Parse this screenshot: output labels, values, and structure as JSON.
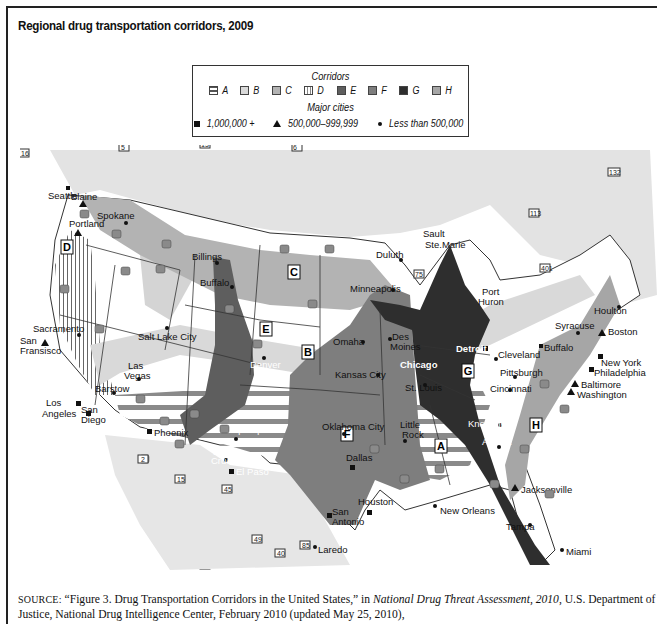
{
  "title": "Regional drug transportation corridors, 2009",
  "legend": {
    "corridors_heading": "Corridors",
    "corridors": [
      {
        "id": "A",
        "label": "A",
        "color": "#bdbdbd",
        "pattern": "horizontal-stripes"
      },
      {
        "id": "B",
        "label": "B",
        "color": "#d9d9d9",
        "pattern": "solid"
      },
      {
        "id": "C",
        "label": "C",
        "color": "#b3b3b3",
        "pattern": "solid"
      },
      {
        "id": "D",
        "label": "D",
        "color": "#ffffff",
        "pattern": "vertical-stripes"
      },
      {
        "id": "E",
        "label": "E",
        "color": "#5e5e5e",
        "pattern": "solid"
      },
      {
        "id": "F",
        "label": "F",
        "color": "#7e7e7e",
        "pattern": "solid"
      },
      {
        "id": "G",
        "label": "G",
        "color": "#2e2e2e",
        "pattern": "solid"
      },
      {
        "id": "H",
        "label": "H",
        "color": "#a6a6a6",
        "pattern": "solid"
      }
    ],
    "cities_heading": "Major cities",
    "city_sizes": [
      {
        "marker": "square",
        "label": "1,000,000 +"
      },
      {
        "marker": "triangle",
        "label": "500,000–999,999"
      },
      {
        "marker": "dot",
        "label": "Less than 500,000"
      }
    ]
  },
  "map": {
    "corridor_labels": [
      "A",
      "B",
      "C",
      "D",
      "E",
      "F",
      "G",
      "H"
    ],
    "cities": [
      {
        "name": "Blaine",
        "size": "dot"
      },
      {
        "name": "Seattle",
        "size": "triangle"
      },
      {
        "name": "Spokane",
        "size": "dot"
      },
      {
        "name": "Portland",
        "size": "triangle"
      },
      {
        "name": "Billings",
        "size": "dot"
      },
      {
        "name": "Buffalo",
        "size": "dot",
        "note": "Wyoming"
      },
      {
        "name": "Duluth",
        "size": "dot"
      },
      {
        "name": "Sault Ste.Marie",
        "size": "dot"
      },
      {
        "name": "Minneapolis",
        "size": "dot"
      },
      {
        "name": "Port Huron",
        "size": "dot"
      },
      {
        "name": "Houlton",
        "size": "dot"
      },
      {
        "name": "Syracuse",
        "size": "dot"
      },
      {
        "name": "Boston",
        "size": "triangle"
      },
      {
        "name": "Buffalo",
        "size": "dot",
        "note": "New York"
      },
      {
        "name": "Detroit",
        "size": "square"
      },
      {
        "name": "Cleveland",
        "size": "dot"
      },
      {
        "name": "Chicago",
        "size": "square"
      },
      {
        "name": "Pittsburgh",
        "size": "dot"
      },
      {
        "name": "New York",
        "size": "square"
      },
      {
        "name": "Philadelphia",
        "size": "square"
      },
      {
        "name": "Baltimore",
        "size": "triangle"
      },
      {
        "name": "Washington",
        "size": "triangle"
      },
      {
        "name": "Sacramento",
        "size": "dot"
      },
      {
        "name": "San Fransisco",
        "size": "triangle"
      },
      {
        "name": "Salt Lake City",
        "size": "dot"
      },
      {
        "name": "Omaha",
        "size": "dot"
      },
      {
        "name": "Des Moines",
        "size": "dot"
      },
      {
        "name": "Denver",
        "size": "dot"
      },
      {
        "name": "Kansas City",
        "size": "dot"
      },
      {
        "name": "St. Louis",
        "size": "dot"
      },
      {
        "name": "Cincinnati",
        "size": "dot"
      },
      {
        "name": "Las Vegas",
        "size": "dot"
      },
      {
        "name": "Barstow",
        "size": "dot"
      },
      {
        "name": "Los Angeles",
        "size": "square"
      },
      {
        "name": "San Diego",
        "size": "square"
      },
      {
        "name": "Phoenix",
        "size": "square"
      },
      {
        "name": "Albuquerque",
        "size": "dot"
      },
      {
        "name": "Las Cruces",
        "size": "dot"
      },
      {
        "name": "El Paso",
        "size": "square"
      },
      {
        "name": "Oklahoma City",
        "size": "dot"
      },
      {
        "name": "Little Rock",
        "size": "dot"
      },
      {
        "name": "Knoxville",
        "size": "dot"
      },
      {
        "name": "Atlanta",
        "size": "dot"
      },
      {
        "name": "Dallas",
        "size": "square"
      },
      {
        "name": "Houston",
        "size": "square"
      },
      {
        "name": "San Antonio",
        "size": "square"
      },
      {
        "name": "Laredo",
        "size": "dot"
      },
      {
        "name": "New Orleans",
        "size": "dot"
      },
      {
        "name": "Jacksonville",
        "size": "triangle"
      },
      {
        "name": "Tampa",
        "size": "dot"
      },
      {
        "name": "Miami",
        "size": "dot"
      }
    ],
    "canada_route_shields": [
      "16",
      "5",
      "1",
      "97",
      "95",
      "13",
      "9",
      "1",
      "3",
      "93",
      "4",
      "3",
      "23",
      "77",
      "6",
      "16",
      "10",
      "1",
      "6",
      "35",
      "39",
      "75",
      "71",
      "11",
      "11",
      "17",
      "144",
      "117",
      "113",
      "117",
      "105",
      "148",
      "401",
      "402",
      "132",
      "7",
      "134",
      "2",
      "1",
      "175",
      "173",
      "155",
      "69"
    ],
    "mexico_route_shields": [
      "2",
      "15",
      "45",
      "49",
      "40",
      "85",
      "40",
      "57",
      "15"
    ]
  },
  "source": {
    "label": "SOURCE:",
    "text_before_title": " “Figure 3. Drug Transportation Corridors in the United States,” in ",
    "publication": "National Drug Threat Assessment, 2010",
    "text_after": ", U.S. Department of Justice, National Drug Intelligence Center, February 2010 (updated May 25, 2010), http://www.justice.gov/ndic/pubs38/38661/38661p.pdf"
  }
}
